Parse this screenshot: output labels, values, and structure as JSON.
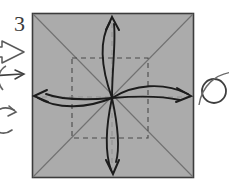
{
  "figure": {
    "kind": "origami-fold-diagram",
    "step_number": "3",
    "canvas": {
      "width": 229,
      "height": 188,
      "background": "#ffffff"
    }
  },
  "paper": {
    "name": "square-sheet",
    "fill_color": "#ababab",
    "border_color": "#3c3c3c",
    "x": 32,
    "y": 13,
    "width": 162,
    "height": 165
  },
  "creases": {
    "diagonal_color": "#6e6e6e",
    "dashed_color": "#4a4a4a",
    "dashed_square": {
      "x": 72,
      "y": 58,
      "width": 76,
      "height": 80
    },
    "diagonals": [
      {
        "name": "diagonal-tl-br",
        "x1": 32,
        "y1": 13,
        "x2": 194,
        "y2": 178
      },
      {
        "name": "diagonal-tr-bl",
        "x1": 194,
        "y1": 13,
        "x2": 32,
        "y2": 178
      }
    ]
  },
  "fold_arrows": {
    "color": "#1c1c1c",
    "origin": {
      "x": 112,
      "y": 98
    },
    "items": [
      {
        "label": "up",
        "direction": "up",
        "tip_x": 112,
        "tip_y": 18
      },
      {
        "label": "down",
        "direction": "down",
        "tip_x": 113,
        "tip_y": 173
      },
      {
        "label": "left",
        "direction": "left",
        "tip_x": 35,
        "tip_y": 96
      },
      {
        "label": "right",
        "direction": "right",
        "tip_x": 190,
        "tip_y": 97
      }
    ]
  },
  "margin_marks": {
    "color": "#555555",
    "left": [
      {
        "name": "step-number",
        "glyph": "3"
      },
      {
        "name": "hollow-arrow",
        "direction": "right"
      },
      {
        "name": "thin-arrow",
        "direction": "right"
      },
      {
        "name": "arc-upper",
        "shape": "partial-circle"
      },
      {
        "name": "curved-arrow-lower",
        "shape": "rotation-arrow"
      }
    ],
    "right": [
      {
        "name": "circle-loop",
        "shape": "circle-with-tail"
      }
    ]
  }
}
